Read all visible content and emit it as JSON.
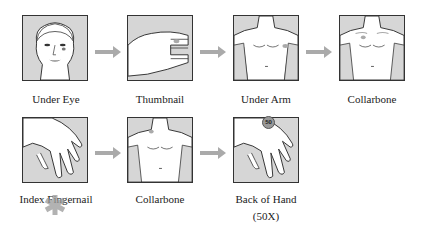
{
  "steps": [
    {
      "label": "Under Eye",
      "image": "face-icon"
    },
    {
      "label": "Thumbnail",
      "image": "thumb-icon"
    },
    {
      "label": "Under Arm",
      "image": "torso-icon"
    },
    {
      "label": "Collarbone",
      "image": "torso-icon"
    },
    {
      "label": "Index Fingernail",
      "image": "hand-icon"
    },
    {
      "label": "Collarbone",
      "image": "torso-icon"
    },
    {
      "label": "Back of Hand",
      "sublabel": "(50X)",
      "image": "hand-icon",
      "badge": "50"
    }
  ],
  "colors": {
    "box_fill": "#d6d6d6",
    "arrow": "#aaaaaa",
    "marker": "#999999"
  }
}
